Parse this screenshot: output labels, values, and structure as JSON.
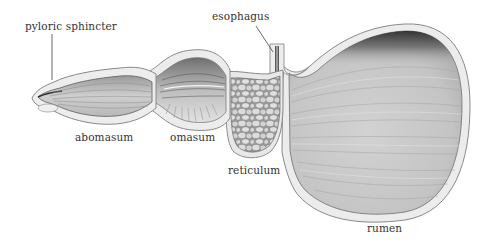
{
  "diagram": {
    "labels": {
      "pyloric_sphincter": "pyloric sphincter",
      "esophagus": "esophagus",
      "abomasum": "abomasum",
      "omasum": "omasum",
      "reticulum": "reticulum",
      "rumen": "rumen"
    },
    "colors": {
      "background": "#ffffff",
      "label_text": "#333333",
      "wall_outer": "#e6e6e6",
      "wall_edge": "#8a8a8a",
      "lumen_light": "#d4d4d4",
      "lumen_dark": "#3a3a3a"
    }
  }
}
